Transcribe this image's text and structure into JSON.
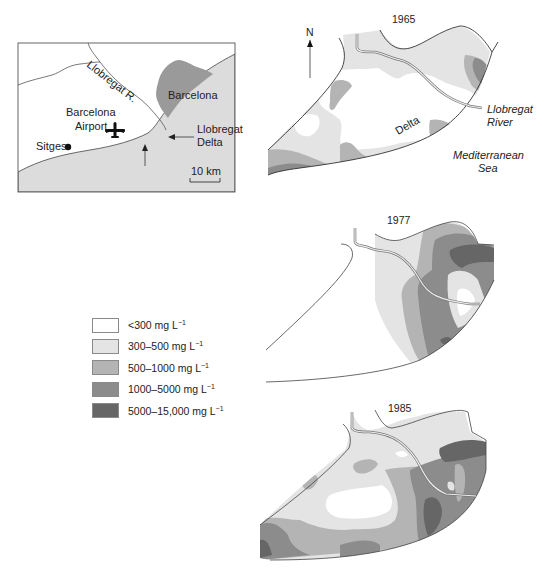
{
  "figure": {
    "type": "map"
  },
  "colors": {
    "lt300": "#ffffff",
    "c300_500": "#e4e4e4",
    "c500_1000": "#b4b4b4",
    "c1000_5000": "#8c8c8c",
    "c5000_15000": "#666666",
    "sea": "#dcdcdc",
    "city": "#9a9a9a",
    "outline": "#333333"
  },
  "inset_map": {
    "labels": {
      "river": "Llobregat R.",
      "city": "Barcelona",
      "airport_line1": "Barcelona",
      "airport_line2": "Airport",
      "delta_line1": "Llobregat",
      "delta_line2": "Delta",
      "town": "Sitges",
      "scale": "10 km"
    },
    "icons": [
      "airplane-icon",
      "town-dot-icon",
      "arrow-icon"
    ]
  },
  "legend": {
    "items": [
      {
        "label": "<300 mg L",
        "sup": "−1",
        "color": "#ffffff"
      },
      {
        "label": "300–500 mg L",
        "sup": "−1",
        "color": "#e4e4e4"
      },
      {
        "label": "500–1000 mg L",
        "sup": "−1",
        "color": "#b4b4b4"
      },
      {
        "label": "1000–5000 mg L",
        "sup": "−1",
        "color": "#8c8c8c"
      },
      {
        "label": "5000–15,000 mg L",
        "sup": "−1",
        "color": "#666666"
      }
    ]
  },
  "panels": [
    {
      "year": "1965",
      "north_label": "N",
      "labels": {
        "delta": "Delta",
        "river_line1": "Llobregat",
        "river_line2": "River",
        "sea_line1": "Mediterranean",
        "sea_line2": "Sea"
      }
    },
    {
      "year": "1977"
    },
    {
      "year": "1985"
    }
  ]
}
